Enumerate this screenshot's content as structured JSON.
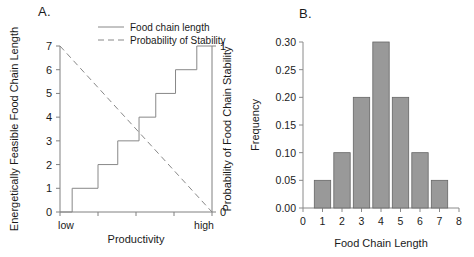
{
  "figure": {
    "panels": [
      {
        "id": "A",
        "label": "A.",
        "type": "step-line",
        "left_axis_title": "Energetically Feasible Food Chain Length",
        "right_axis_title": "Probability of Food Chain Stability",
        "x_axis_title": "Productivity",
        "x_low_label": "low",
        "x_high_label": "high",
        "left_ticks": [
          "0",
          "1",
          "2",
          "3",
          "4",
          "5",
          "6",
          "7"
        ],
        "right_ticks": [
          "0",
          "1"
        ],
        "legend": [
          {
            "label": "Food chain length",
            "style": "solid",
            "color": "#888888"
          },
          {
            "label": "Probability of Stability",
            "style": "dashed",
            "color": "#888888"
          }
        ]
      },
      {
        "id": "B",
        "label": "B.",
        "type": "histogram",
        "x_axis_title": "Food Chain Length",
        "y_axis_title": "Frequency",
        "y_ticks": [
          "0.00",
          "0.05",
          "0.10",
          "0.15",
          "0.20",
          "0.25",
          "0.30"
        ],
        "x_ticks": [
          "0",
          "1",
          "2",
          "3",
          "4",
          "5",
          "6",
          "7",
          "8"
        ]
      }
    ]
  },
  "chart_data": [
    {
      "type": "line",
      "title": "A.",
      "xlabel": "Productivity",
      "ylabel": "Energetically Feasible Food Chain Length",
      "y2label": "Probability of Food Chain Stability",
      "xlim": [
        0,
        1
      ],
      "ylim": [
        0,
        7
      ],
      "y2lim": [
        0,
        1
      ],
      "grid": false,
      "legend_position": "top-center",
      "xtick_labels": [
        "low",
        "high"
      ],
      "series": [
        {
          "name": "Food chain length",
          "style": "step",
          "line": "solid",
          "color": "#888888",
          "x": [
            0.0,
            0.08,
            0.08,
            0.25,
            0.25,
            0.38,
            0.38,
            0.52,
            0.52,
            0.63,
            0.63,
            0.76,
            0.76,
            0.9,
            0.9,
            1.0
          ],
          "values": [
            0,
            0,
            1,
            1,
            2,
            2,
            3,
            3,
            4,
            4,
            5,
            5,
            6,
            6,
            7,
            7
          ]
        },
        {
          "name": "Probability of Stability",
          "style": "line",
          "line": "dashed",
          "color": "#888888",
          "axis": "right",
          "x": [
            0.0,
            1.0
          ],
          "values": [
            1.0,
            0.0
          ]
        }
      ]
    },
    {
      "type": "bar",
      "title": "B.",
      "xlabel": "Food Chain Length",
      "ylabel": "Frequency",
      "xlim": [
        0,
        8
      ],
      "ylim": [
        0.0,
        0.3
      ],
      "grid": false,
      "bar_color": "#999999",
      "bar_edge_color": "#666666",
      "categories": [
        "1",
        "2",
        "3",
        "4",
        "5",
        "6",
        "7"
      ],
      "values": [
        0.05,
        0.1,
        0.2,
        0.3,
        0.2,
        0.1,
        0.05
      ]
    }
  ]
}
